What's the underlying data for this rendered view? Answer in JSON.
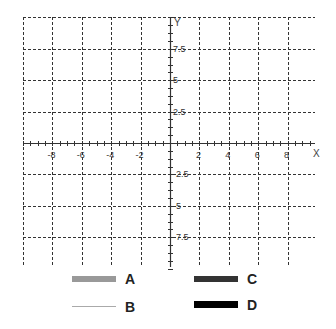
{
  "chart_data": {
    "type": "line",
    "title": "",
    "xlabel": "X",
    "ylabel": "Y",
    "xlim": [
      -10,
      10
    ],
    "ylim": [
      -10,
      10
    ],
    "grid": true,
    "grid_style": "dashed",
    "x_ticks": [
      -8,
      -6,
      -4,
      -2,
      2,
      4,
      6,
      8
    ],
    "x_tick_labels": [
      "-8",
      "-6",
      "-4",
      "-2",
      "2",
      "4",
      "6",
      "8"
    ],
    "y_ticks": [
      7.5,
      5,
      2.5,
      -2.5,
      -5,
      -7.5
    ],
    "y_tick_labels": [
      "7.5",
      "5",
      "2.5",
      "-2.5",
      "-5",
      "-7.5"
    ],
    "legend_position": "bottom",
    "series": [
      {
        "name": "A",
        "color": "#999999",
        "style": "thick",
        "values": []
      },
      {
        "name": "B",
        "color": "#aaaaaa",
        "style": "thin",
        "values": []
      },
      {
        "name": "C",
        "color": "#333333",
        "style": "thick",
        "values": []
      },
      {
        "name": "D",
        "color": "#000000",
        "style": "thick",
        "values": []
      }
    ]
  },
  "legend": {
    "items": [
      {
        "label": "A",
        "color": "#999999"
      },
      {
        "label": "B",
        "color": "#aaaaaa"
      },
      {
        "label": "C",
        "color": "#333333"
      },
      {
        "label": "D",
        "color": "#000000"
      }
    ]
  }
}
